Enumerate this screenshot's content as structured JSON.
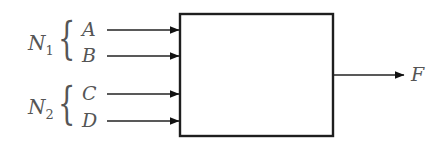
{
  "diagram": {
    "block": {
      "label": ""
    },
    "groups": [
      {
        "name": "N",
        "subscript": "1",
        "inputs": [
          "A",
          "B"
        ]
      },
      {
        "name": "N",
        "subscript": "2",
        "inputs": [
          "C",
          "D"
        ]
      }
    ],
    "output": {
      "label": "F"
    },
    "colors": {
      "line": "#1e1e1e",
      "text": "#555555",
      "background": "#ffffff"
    }
  }
}
